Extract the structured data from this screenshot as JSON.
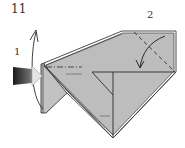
{
  "diagram": {
    "step_number": "11",
    "sub_steps": [
      {
        "label": "1",
        "action": "swing-flap-up",
        "icon": "curved-arrow-up-icon"
      },
      {
        "label": "2",
        "action": "fold-corner-down",
        "icon": "curved-arrow-down-icon"
      }
    ],
    "indicators": {
      "push_arrow": "push-arrow-icon"
    },
    "colors": {
      "paper_fill": "#bdbdbd",
      "paper_fill_light": "#c9c9c9",
      "edge": "#3a3a3a",
      "crease": "#2b2b2b",
      "background": "#ffffff",
      "push_arrow_dark": "#1a1a1a",
      "push_arrow_light": "#d8d8d8"
    }
  }
}
